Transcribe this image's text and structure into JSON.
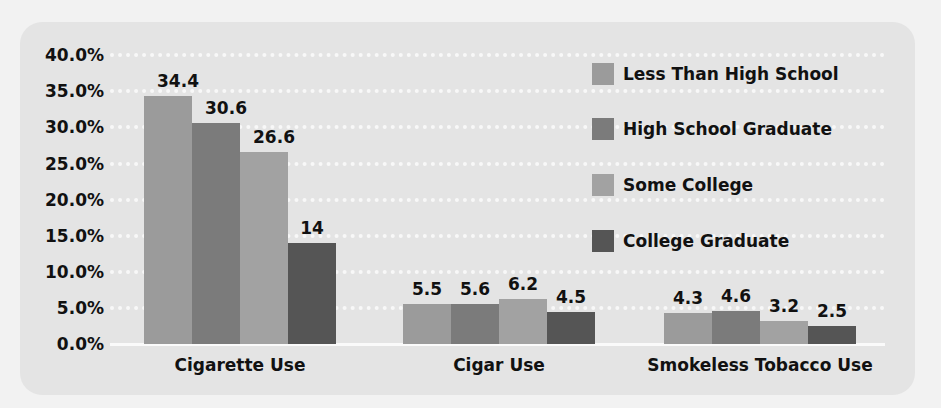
{
  "chart_data": {
    "type": "bar",
    "title": "",
    "xlabel": "",
    "ylabel": "",
    "ylim": [
      0,
      40
    ],
    "ytick_labels": [
      "0.0%",
      "5.0%",
      "10.0%",
      "15.0%",
      "20.0%",
      "25.0%",
      "30.0%",
      "35.0%",
      "40.0%"
    ],
    "grid": true,
    "legend_position": "upper right",
    "categories": [
      "Cigarette Use",
      "Cigar Use",
      "Smokeless Tobacco Use"
    ],
    "series": [
      {
        "name": "Less Than High School",
        "values": [
          34.4,
          5.5,
          4.3
        ],
        "labels": [
          "34.4",
          "5.5",
          "4.3"
        ],
        "color": "#9b9b9b"
      },
      {
        "name": "High School Graduate",
        "values": [
          30.6,
          5.6,
          4.6
        ],
        "labels": [
          "30.6",
          "5.6",
          "4.6"
        ],
        "color": "#7b7b7b"
      },
      {
        "name": "Some College",
        "values": [
          26.6,
          6.2,
          3.2
        ],
        "labels": [
          "26.6",
          "6.2",
          "3.2"
        ],
        "color": "#a2a2a2"
      },
      {
        "name": "College Graduate",
        "values": [
          14,
          4.5,
          2.5
        ],
        "labels": [
          "14",
          "4.5",
          "2.5"
        ],
        "color": "#555555"
      }
    ]
  },
  "colors": {
    "background": "#f2f2f2",
    "panel": "#e4e4e4",
    "gridline": "#f8f8f8",
    "text": "#111111"
  }
}
